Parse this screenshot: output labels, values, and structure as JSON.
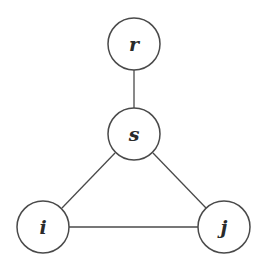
{
  "diagram": {
    "type": "graph",
    "nodes": [
      {
        "id": "r",
        "label": "r",
        "cx": 134,
        "cy": 44,
        "r": 26
      },
      {
        "id": "s",
        "label": "s",
        "cx": 134,
        "cy": 134,
        "r": 26
      },
      {
        "id": "i",
        "label": "i",
        "cx": 43,
        "cy": 227,
        "r": 26
      },
      {
        "id": "j",
        "label": "j",
        "cx": 224,
        "cy": 227,
        "r": 26
      }
    ],
    "edges": [
      {
        "from": "r",
        "to": "s"
      },
      {
        "from": "s",
        "to": "i"
      },
      {
        "from": "s",
        "to": "j"
      },
      {
        "from": "i",
        "to": "j"
      }
    ],
    "colors": {
      "stroke": "#4a4a4a",
      "background": "#ffffff",
      "text": "#2a2a2a"
    }
  }
}
